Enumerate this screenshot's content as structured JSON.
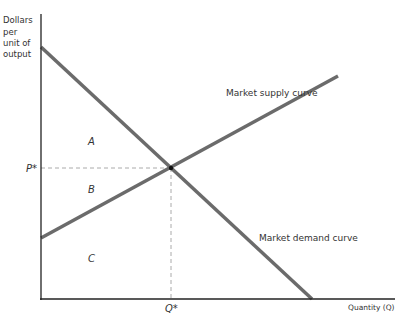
{
  "diagram": {
    "y_axis_label_lines": [
      "Dollars",
      "per",
      "unit of",
      "output"
    ],
    "x_axis_label": "Quantity (Q)",
    "p_star_label": "P*",
    "q_star_label": "Q*",
    "supply_label": "Market supply curve",
    "demand_label": "Market demand curve",
    "region_a": "A",
    "region_b": "B",
    "region_c": "C",
    "curve_color": "#6b6b6b",
    "axis_color": "#222222",
    "dash_color": "#aaaaaa"
  }
}
